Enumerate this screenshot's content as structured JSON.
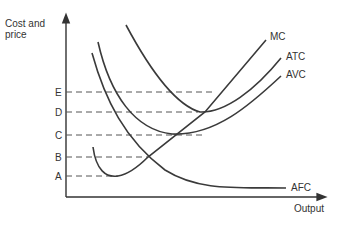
{
  "chart_data": {
    "type": "line",
    "title": "",
    "xlabel": "Output",
    "ylabel": "Cost and price",
    "grid": false,
    "legend": "curve-end labels",
    "y_levels": [
      {
        "label": "E",
        "y": 92,
        "x_end": 212
      },
      {
        "label": "D",
        "y": 112,
        "x_end": 198
      },
      {
        "label": "C",
        "y": 135,
        "x_end": 204
      },
      {
        "label": "B",
        "y": 157,
        "x_end": 148
      },
      {
        "label": "A",
        "y": 176,
        "x_end": 118
      }
    ],
    "series": [
      {
        "name": "MC",
        "label": "MC",
        "path": "M93,147 C96,170 106,178 118,176 C130,174 140,165 148,157 L205,112 L266,40"
      },
      {
        "name": "ATC",
        "label": "ATC",
        "path": "M126,25 C150,70 175,105 200,112 C225,113 255,90 281,58"
      },
      {
        "name": "AVC",
        "label": "AVC",
        "path": "M98,42 C110,95 135,130 172,134 C215,136 250,105 281,76"
      },
      {
        "name": "AFC",
        "label": "AFC",
        "path": "M92,53 C105,100 125,140 165,170 C200,192 240,187 286,188"
      }
    ]
  },
  "labels": {
    "y_axis": [
      "Cost and",
      "price"
    ],
    "x_axis": "Output",
    "mc": "MC",
    "atc": "ATC",
    "avc": "AVC",
    "afc": "AFC",
    "e": "E",
    "d": "D",
    "c": "C",
    "b": "B",
    "a": "A"
  }
}
